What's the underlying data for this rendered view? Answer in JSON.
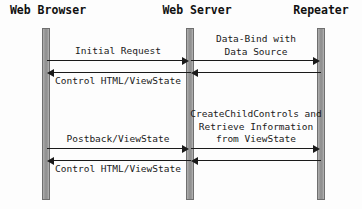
{
  "diagram": {
    "type": "uml-sequence-diagram",
    "colors": {
      "background": "#fdfdfd",
      "lifeline_fill": "#9a9a9a",
      "lifeline_border": "#6f6f6f",
      "arrow": "#1a1a1a",
      "text": "#1a1a1a",
      "header_text": "#111111"
    },
    "participants": [
      {
        "id": "web-browser",
        "label": "Web Browser",
        "x": 46,
        "label_x": 48
      },
      {
        "id": "web-server",
        "label": "Web Server",
        "x": 190,
        "label_x": 197
      },
      {
        "id": "repeater",
        "label": "Repeater",
        "x": 321,
        "label_x": 321
      }
    ],
    "lifelines": [
      {
        "id": "lifeline-web-browser",
        "x": 46,
        "top": 28,
        "height": 172
      },
      {
        "id": "lifeline-web-server",
        "x": 190,
        "top": 28,
        "height": 172
      },
      {
        "id": "lifeline-repeater",
        "x": 321,
        "top": 28,
        "height": 172
      }
    ],
    "messages": [
      {
        "id": "initial-request",
        "label": "Initial Request",
        "direction": "right",
        "from": "web-browser",
        "to": "web-server",
        "x1": 46,
        "x2": 190,
        "y": 60,
        "label_x": 118,
        "label_y": 45
      },
      {
        "id": "data-bind-with-data-source",
        "label": "Data-Bind with\nData Source",
        "direction": "right",
        "from": "web-server",
        "to": "repeater",
        "x1": 190,
        "x2": 321,
        "y": 60,
        "label_x": 256,
        "label_y": 33
      },
      {
        "id": "control-html-viewstate-1",
        "label": "Control HTML/ViewState",
        "direction": "left",
        "from": "web-server",
        "to": "web-browser",
        "x1": 190,
        "x2": 46,
        "y": 72,
        "label_x": 118,
        "label_y": 75
      },
      {
        "id": "repeater-return-1",
        "label": "",
        "direction": "left",
        "from": "repeater",
        "to": "web-server",
        "x1": 321,
        "x2": 190,
        "y": 72,
        "label_x": 256,
        "label_y": 75
      },
      {
        "id": "postback-viewstate",
        "label": "Postback/ViewState",
        "direction": "right",
        "from": "web-browser",
        "to": "web-server",
        "x1": 46,
        "x2": 190,
        "y": 148,
        "label_x": 118,
        "label_y": 133
      },
      {
        "id": "createchildcontrols-retrieve",
        "label": "CreateChildControls and\nRetrieve Information\nfrom ViewState",
        "direction": "right",
        "from": "web-server",
        "to": "repeater",
        "x1": 190,
        "x2": 321,
        "y": 148,
        "label_x": 256,
        "label_y": 108
      },
      {
        "id": "control-html-viewstate-2",
        "label": "Control HTML/ViewState",
        "direction": "left",
        "from": "web-server",
        "to": "web-browser",
        "x1": 190,
        "x2": 46,
        "y": 160,
        "label_x": 118,
        "label_y": 163
      },
      {
        "id": "repeater-return-2",
        "label": "",
        "direction": "left",
        "from": "repeater",
        "to": "web-server",
        "x1": 321,
        "x2": 190,
        "y": 160,
        "label_x": 256,
        "label_y": 163
      }
    ]
  }
}
